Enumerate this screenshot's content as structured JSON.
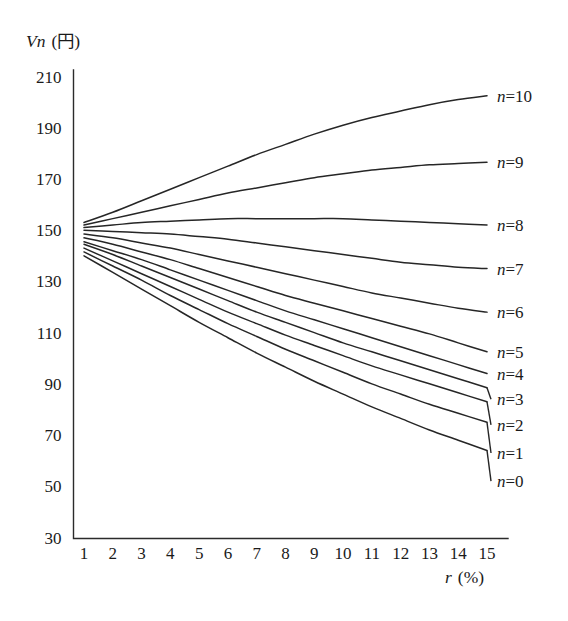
{
  "chart_data": {
    "type": "line",
    "title": "",
    "ylabel": "Vn (円)",
    "ylabel_symbol": "Vn",
    "ylabel_unit": "(円)",
    "xlabel": "r (%)",
    "xlabel_symbol": "r",
    "xlabel_unit": "(%)",
    "grid": false,
    "legend_position": "right-inline",
    "xlim": [
      1,
      15
    ],
    "ylim": [
      30,
      210
    ],
    "yticks": [
      30,
      50,
      70,
      90,
      110,
      130,
      150,
      170,
      190,
      210
    ],
    "xticks": [
      1,
      2,
      3,
      4,
      5,
      6,
      7,
      8,
      9,
      10,
      11,
      12,
      13,
      14,
      15
    ],
    "x": [
      1,
      2,
      3,
      4,
      5,
      6,
      7,
      8,
      9,
      10,
      11,
      12,
      13,
      14,
      15
    ],
    "series": [
      {
        "name": "n=10",
        "label": "n=10",
        "n": 10,
        "color": "#262626",
        "values": [
          153,
          157,
          161.5,
          166,
          170.5,
          175,
          179.5,
          183.5,
          187.5,
          191,
          194,
          196.5,
          199,
          201,
          202.5
        ]
      },
      {
        "name": "n=9",
        "label": "n=9",
        "n": 9,
        "color": "#262626",
        "values": [
          152,
          154.5,
          157,
          159.5,
          162,
          164.5,
          166.5,
          168.5,
          170.5,
          172,
          173.5,
          174.5,
          175.5,
          176,
          176.5
        ]
      },
      {
        "name": "n=8",
        "label": "n=8",
        "n": 8,
        "color": "#262626",
        "values": [
          151,
          152,
          153,
          153.5,
          154,
          154.5,
          154.5,
          154.5,
          154.5,
          154.5,
          154,
          153.5,
          153,
          152.5,
          152
        ]
      },
      {
        "name": "n=7",
        "label": "n=7",
        "n": 7,
        "color": "#262626",
        "values": [
          150,
          149.5,
          149,
          148.5,
          147.5,
          146.5,
          145,
          143.5,
          142,
          140.5,
          139,
          137.5,
          136.5,
          135.5,
          135
        ]
      },
      {
        "name": "n=6",
        "label": "n=6",
        "n": 6,
        "color": "#262626",
        "values": [
          148.5,
          147,
          145,
          143,
          140.5,
          138,
          135.5,
          133,
          130.5,
          128,
          125.5,
          123.5,
          121.5,
          119.5,
          118
        ]
      },
      {
        "name": "n=5",
        "label": "n=5",
        "n": 5,
        "color": "#262626",
        "values": [
          147,
          144.5,
          141.5,
          138.5,
          135,
          131.5,
          128,
          124.5,
          121.5,
          118.5,
          115.5,
          112.5,
          109.5,
          106,
          102.5
        ]
      },
      {
        "name": "n=4",
        "label": "n=4",
        "n": 4,
        "color": "#262626",
        "values": [
          145.5,
          142,
          138.5,
          134.5,
          130.5,
          126.5,
          122.5,
          118.5,
          115,
          111.5,
          108,
          104.5,
          101,
          97.5,
          94
        ]
      },
      {
        "name": "n=3",
        "label": "n=3",
        "n": 3,
        "color": "#262626",
        "values": [
          144.5,
          140.5,
          136,
          131.5,
          127,
          122.5,
          118,
          114,
          110,
          106,
          102.5,
          99,
          95.5,
          92,
          88.5
        ]
      },
      {
        "name": "n=2",
        "label": "n=2",
        "n": 2,
        "color": "#262626",
        "values": [
          143,
          138,
          133,
          128,
          123,
          118,
          113.5,
          109,
          105,
          101,
          97,
          93.5,
          90,
          86.5,
          83
        ]
      },
      {
        "name": "n=1",
        "label": "n=1",
        "n": 1,
        "color": "#262626",
        "values": [
          141.5,
          136,
          130.5,
          124.5,
          119,
          113.5,
          108.5,
          103.5,
          99,
          94.5,
          90,
          86,
          82,
          78.5,
          75
        ]
      },
      {
        "name": "n=0",
        "label": "n=0",
        "n": 0,
        "color": "#262626",
        "values": [
          140,
          133.5,
          127,
          120.5,
          114,
          108,
          102,
          96.5,
          91,
          86,
          81,
          76.5,
          72,
          68,
          64
        ]
      }
    ],
    "series_label_positions": [
      {
        "label": "n=10",
        "value": 202.5
      },
      {
        "label": "n=9",
        "value": 176.5
      },
      {
        "label": "n=8",
        "value": 152
      },
      {
        "label": "n=7",
        "value": 135
      },
      {
        "label": "n=6",
        "value": 118
      },
      {
        "label": "n=5",
        "value": 102.5
      },
      {
        "label": "n=4",
        "value": 94
      },
      {
        "label": "n=3",
        "value": 84
      },
      {
        "label": "n=2",
        "value": 74
      },
      {
        "label": "n=1",
        "value": 63
      },
      {
        "label": "n=0",
        "value": 52
      }
    ]
  }
}
